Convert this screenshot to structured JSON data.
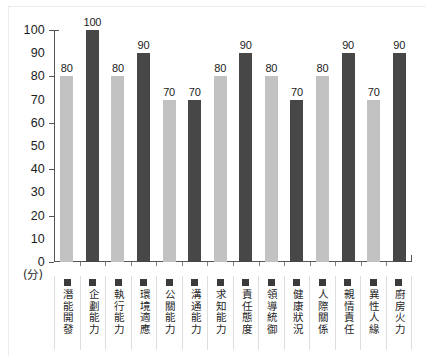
{
  "chart_data": {
    "type": "bar",
    "title": "",
    "xlabel": "",
    "ylabel": "(分)",
    "ylim": [
      0,
      100
    ],
    "ytick_step": 10,
    "grid": false,
    "legend_position": "bottom",
    "categories": [
      "潛能開發",
      "企劃能力",
      "執行能力",
      "環境適應",
      "公關能力",
      "溝通能力",
      "求知能力",
      "責任態度",
      "領導統御",
      "健康狀況",
      "人際關係",
      "親情責任",
      "異性人緣",
      "廚房火力"
    ],
    "values": [
      80,
      100,
      80,
      90,
      70,
      70,
      80,
      90,
      80,
      70,
      80,
      90,
      70,
      90
    ],
    "ytick_labels": [
      "0",
      "10",
      "20",
      "30",
      "40",
      "50",
      "60",
      "70",
      "80",
      "90",
      "100"
    ],
    "major_ytick_values": [
      0,
      20,
      40,
      60,
      80,
      100
    ],
    "colors": {
      "light_bar": "#c2c2c2",
      "dark_bar": "#474747",
      "axis": "#555555",
      "text": "#1b1b1b",
      "legend_swatch": "#3b3b3b",
      "background": "#ffffff"
    }
  }
}
